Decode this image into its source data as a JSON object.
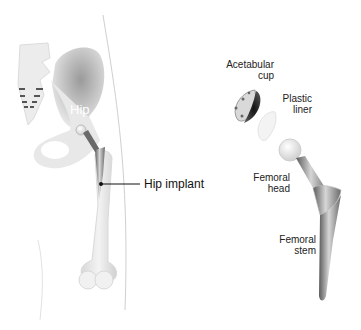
{
  "figure": {
    "left_panel": {
      "region_label": "Hip",
      "callout_label": "Hip implant"
    },
    "right_panel": {
      "components": [
        {
          "label_line1": "Acetabular",
          "label_line2": "cup"
        },
        {
          "label_line1": "Plastic",
          "label_line2": "liner"
        },
        {
          "label_line1": "Femoral",
          "label_line2": "head"
        },
        {
          "label_line1": "Femoral",
          "label_line2": "stem"
        }
      ]
    },
    "colors": {
      "background": "#ffffff",
      "bone": "#e9e9e9",
      "bone_shadow": "#bdbdbd",
      "metal_dark": "#4a4a4a",
      "metal_light": "#c8c8c8",
      "text": "#222222"
    }
  }
}
